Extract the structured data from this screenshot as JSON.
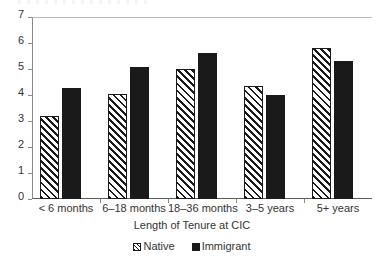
{
  "chart_data": {
    "type": "bar",
    "title": "",
    "xlabel": "Length of Tenure at CIC",
    "ylabel": "",
    "ylim": [
      0,
      7
    ],
    "yticks": [
      0,
      1,
      2,
      3,
      4,
      5,
      6,
      7
    ],
    "ytick_labels": [
      "0",
      "1",
      "2",
      "3",
      "4",
      "5",
      "6",
      "7"
    ],
    "grid": false,
    "legend_position": "bottom",
    "categories": [
      "< 6 months",
      "6–18 months",
      "18–36 months",
      "3–5 years",
      "5+ years"
    ],
    "series": [
      {
        "name": "Native",
        "fill": "diagonal-hatch",
        "color": "#1a1a1a",
        "values": [
          3.2,
          4.05,
          5.0,
          4.35,
          5.8
        ]
      },
      {
        "name": "Immigrant",
        "fill": "solid",
        "color": "#1a1a1a",
        "values": [
          4.27,
          5.08,
          5.6,
          4.0,
          5.3
        ]
      }
    ]
  },
  "legend": {
    "items": [
      {
        "label": "Native"
      },
      {
        "label": "Immigrant"
      }
    ]
  },
  "axis": {
    "x_title": "Length of Tenure at CIC"
  }
}
